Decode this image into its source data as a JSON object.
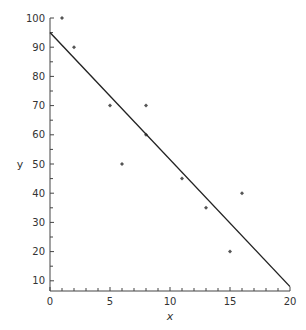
{
  "chart_data": {
    "type": "scatter",
    "title": "",
    "xlabel": "x",
    "ylabel": "y",
    "xlim": [
      0,
      20
    ],
    "ylim": [
      6,
      100
    ],
    "x_ticks": [
      0,
      5,
      10,
      15,
      20
    ],
    "y_ticks": [
      10,
      20,
      30,
      40,
      50,
      60,
      70,
      80,
      90,
      100
    ],
    "grid": false,
    "legend": null,
    "series": [
      {
        "name": "data",
        "type": "scatter",
        "points": [
          {
            "x": 1,
            "y": 100
          },
          {
            "x": 2,
            "y": 90
          },
          {
            "x": 5,
            "y": 70
          },
          {
            "x": 6,
            "y": 50
          },
          {
            "x": 8,
            "y": 70
          },
          {
            "x": 8,
            "y": 60
          },
          {
            "x": 11,
            "y": 45
          },
          {
            "x": 13,
            "y": 35
          },
          {
            "x": 15,
            "y": 20
          },
          {
            "x": 16,
            "y": 40
          }
        ]
      },
      {
        "name": "regression line",
        "type": "line",
        "points": [
          {
            "x": 0,
            "y": 95
          },
          {
            "x": 20,
            "y": 8
          }
        ]
      }
    ]
  }
}
